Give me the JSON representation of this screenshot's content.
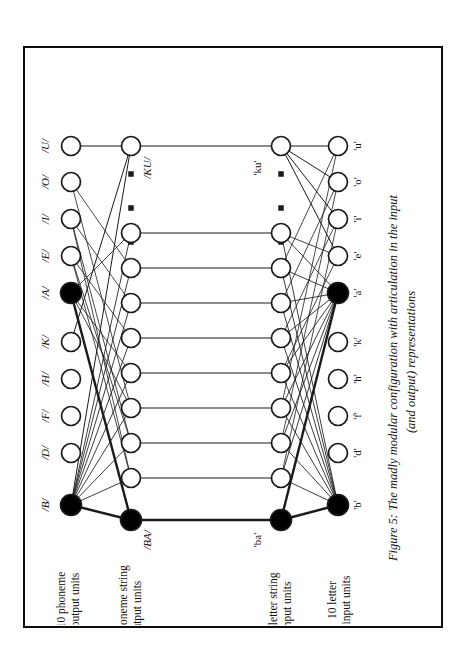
{
  "figure": {
    "caption_label": "Figure 5:",
    "caption_line1": "The madly modular configuration with articulation in the input",
    "caption_line2": "(and output) representations",
    "border_color": "#0d0d0d",
    "node_fill_open": "#ffffff",
    "node_fill_active": "#000000",
    "edge_color": "#1a1a1a"
  },
  "layers": {
    "phoneme_output": {
      "group_label_line1": "10 phoneme",
      "group_label_line2": "output units",
      "count": 10,
      "units": [
        {
          "label": "/B/",
          "active": true
        },
        {
          "label": "/D/",
          "active": false
        },
        {
          "label": "/F/",
          "active": false
        },
        {
          "label": "/H/",
          "active": false
        },
        {
          "label": "/K/",
          "active": false
        },
        {
          "label": "/A/",
          "active": true
        },
        {
          "label": "/E/",
          "active": false
        },
        {
          "label": "/I/",
          "active": false
        },
        {
          "label": "/O/",
          "active": false
        },
        {
          "label": "/U/",
          "active": false
        }
      ]
    },
    "phoneme_string_output": {
      "group_label_line1": "25 phoneme string",
      "group_label_line2": "output units",
      "count": 25,
      "first_label": "/BA/",
      "last_label": "/KU/",
      "visible_units": 10,
      "ellipsis_dots": 3,
      "units": [
        {
          "label": "/BA/",
          "active": true
        },
        {
          "label": "",
          "active": false
        },
        {
          "label": "",
          "active": false
        },
        {
          "label": "",
          "active": false
        },
        {
          "label": "",
          "active": false
        },
        {
          "label": "",
          "active": false
        },
        {
          "label": "",
          "active": false
        },
        {
          "label": "",
          "active": false
        },
        {
          "label": "",
          "active": false
        },
        {
          "label": "/KU/",
          "active": false
        }
      ]
    },
    "letter_string_input": {
      "group_label_line1": "25 letter string",
      "group_label_line2": "input units",
      "count": 25,
      "first_label": "'ba'",
      "last_label": "'ku'",
      "visible_units": 10,
      "ellipsis_dots": 3,
      "units": [
        {
          "label": "'ba'",
          "active": true
        },
        {
          "label": "",
          "active": false
        },
        {
          "label": "",
          "active": false
        },
        {
          "label": "",
          "active": false
        },
        {
          "label": "",
          "active": false
        },
        {
          "label": "",
          "active": false
        },
        {
          "label": "",
          "active": false
        },
        {
          "label": "",
          "active": false
        },
        {
          "label": "",
          "active": false
        },
        {
          "label": "'ku'",
          "active": false
        }
      ]
    },
    "letter_input": {
      "group_label_line1": "10 letter",
      "group_label_line2": "input units",
      "count": 10,
      "units": [
        {
          "label": "'b'",
          "active": true
        },
        {
          "label": "'d'",
          "active": false
        },
        {
          "label": "'f'",
          "active": false
        },
        {
          "label": "'h'",
          "active": false
        },
        {
          "label": "'k'",
          "active": false
        },
        {
          "label": "'a'",
          "active": true
        },
        {
          "label": "'e'",
          "active": false
        },
        {
          "label": "'i'",
          "active": false
        },
        {
          "label": "'o'",
          "active": false
        },
        {
          "label": "'u'",
          "active": false
        }
      ]
    }
  }
}
